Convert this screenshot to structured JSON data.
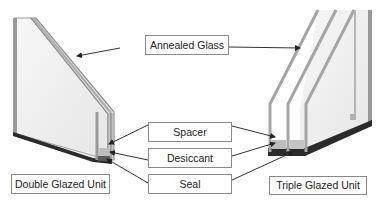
{
  "diagram": {
    "components": {
      "annealed_glass": "Annealed Glass",
      "spacer": "Spacer",
      "desiccant": "Desiccant",
      "seal": "Seal"
    },
    "units": {
      "double": "Double Glazed Unit",
      "triple": "Triple Glazed Unit"
    },
    "colors": {
      "glass_edge": "#a9a9a9",
      "glass_fill": "#f2f2f2",
      "seal": "#2b2b2b",
      "arrow": "#333333",
      "box_border": "#8a8a8a"
    }
  }
}
